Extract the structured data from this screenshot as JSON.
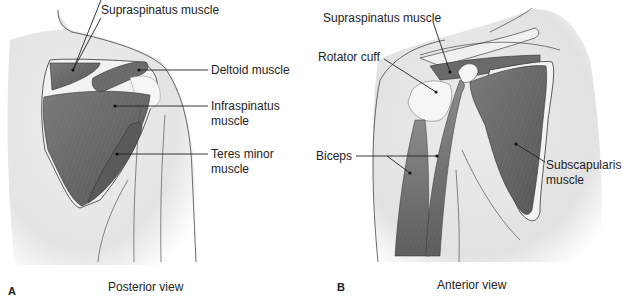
{
  "figure": {
    "panels": [
      {
        "letter": "A",
        "caption": "Posterior view",
        "labels": [
          {
            "id": "supraspinatus",
            "text": "Supraspinatus muscle"
          },
          {
            "id": "deltoid",
            "text": "Deltoid muscle"
          },
          {
            "id": "infraspinatus",
            "line1": "Infraspinatus",
            "line2": "muscle"
          },
          {
            "id": "teres-minor",
            "line1": "Teres minor",
            "line2": "muscle"
          }
        ]
      },
      {
        "letter": "B",
        "caption": "Anterior view",
        "labels": [
          {
            "id": "supraspinatus",
            "text": "Supraspinatus muscle"
          },
          {
            "id": "rotator-cuff",
            "text": "Rotator cuff"
          },
          {
            "id": "biceps",
            "text": "Biceps"
          },
          {
            "id": "subscapularis",
            "line1": "Subscapularis",
            "line2": "muscle"
          }
        ]
      }
    ]
  },
  "colors": {
    "muscle": "#6e6e6e",
    "muscle_dark": "#4a4a4a",
    "skin": "#e6e6e6",
    "bone": "#f0f0f0",
    "outline": "#333333"
  }
}
